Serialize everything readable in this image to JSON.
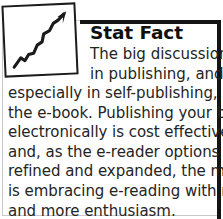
{
  "callout": {
    "kind": "stat-fact-sidebar",
    "heading": "Stat Fact",
    "icon": {
      "name": "growth-chart-icon",
      "description": "upward zigzag trend arrow inside a tilted square frame"
    },
    "body_full": "The big discussion in publishing, and especially in self-publishing, is the e-book. Publishing your book electronically is cost effective, and, as the e-reader options are refined and expanded, the market is embracing e-reading with more and more enthusiasm.",
    "lead_lines": [
      "The big discussion",
      "in publishing, and"
    ],
    "body_lines": [
      "especially in self-publishing, is",
      "the e-book. Publishing your book",
      "electronically is cost effective,",
      "and, as the e-reader options are",
      "refined and expanded, the market",
      "is embracing e-reading with more",
      "and more enthusiasm."
    ]
  },
  "colors": {
    "rule": "#141414",
    "hairline": "#c9c9c9",
    "heading_text": "#101010",
    "body_text": "#242424",
    "background": "#ffffff"
  }
}
